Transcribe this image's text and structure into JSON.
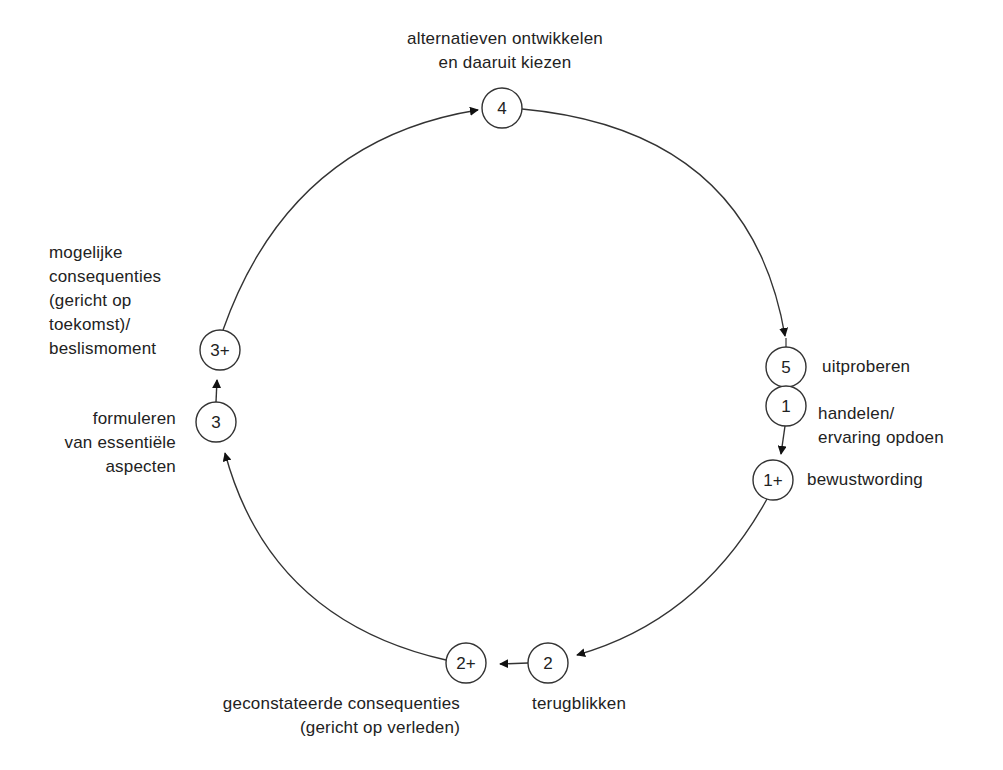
{
  "diagram": {
    "type": "cycle",
    "nodes": [
      {
        "id": "4",
        "label": "4",
        "x": 502,
        "y": 108,
        "text": [
          "alternatieven ontwikkelen",
          "en daaruit kiezen"
        ]
      },
      {
        "id": "5",
        "label": "5",
        "x": 786,
        "y": 367,
        "text": [
          "uitproberen"
        ]
      },
      {
        "id": "1",
        "label": "1",
        "x": 786,
        "y": 406,
        "text": [
          "handelen/",
          "ervaring opdoen"
        ]
      },
      {
        "id": "1+",
        "label": "1+",
        "x": 773,
        "y": 480,
        "text": [
          "bewustwording"
        ]
      },
      {
        "id": "2",
        "label": "2",
        "x": 548,
        "y": 663,
        "text": [
          "terugblikken"
        ]
      },
      {
        "id": "2+",
        "label": "2+",
        "x": 466,
        "y": 663,
        "text": [
          "geconstateerde consequenties",
          "(gericht op verleden)"
        ]
      },
      {
        "id": "3",
        "label": "3",
        "x": 216,
        "y": 422,
        "text": [
          "formuleren",
          "van essentiële",
          "aspecten"
        ]
      },
      {
        "id": "3+",
        "label": "3+",
        "x": 220,
        "y": 350,
        "text": [
          "mogelijke",
          "consequenties",
          "(gericht op",
          "toekomst)/",
          "beslismoment"
        ]
      }
    ],
    "edges": [
      {
        "from": "4",
        "to": "5",
        "style": "arc"
      },
      {
        "from": "1",
        "to": "1+",
        "style": "straight"
      },
      {
        "from": "1+",
        "to": "2",
        "style": "arc"
      },
      {
        "from": "2",
        "to": "2+",
        "style": "straight"
      },
      {
        "from": "2+",
        "to": "3",
        "style": "arc"
      },
      {
        "from": "3",
        "to": "3+",
        "style": "straight"
      },
      {
        "from": "3+",
        "to": "4",
        "style": "arc"
      }
    ],
    "colors": {
      "stroke": "#333333",
      "text": "#222222",
      "background": "#ffffff"
    }
  }
}
